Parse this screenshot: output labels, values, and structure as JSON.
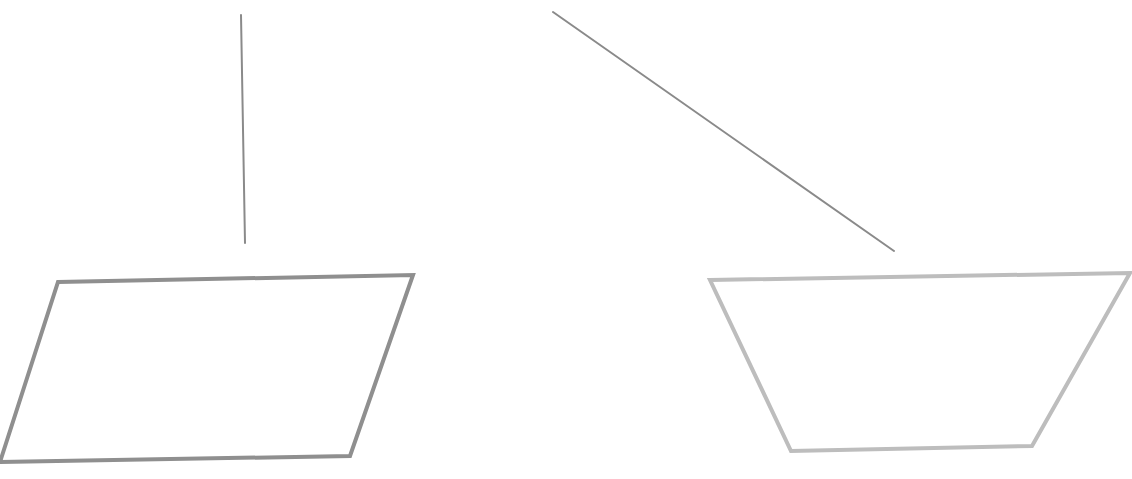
{
  "diagram": {
    "background": "#ffffff",
    "shapes": [
      {
        "id": "vertical-line",
        "type": "line",
        "points": [
          [
            241,
            15
          ],
          [
            245,
            243
          ]
        ],
        "stroke": "#8a8a8a",
        "stroke_width": 2
      },
      {
        "id": "diagonal-line",
        "type": "line",
        "points": [
          [
            553,
            12
          ],
          [
            894,
            251
          ]
        ],
        "stroke": "#8a8a8a",
        "stroke_width": 2
      },
      {
        "id": "parallelogram",
        "type": "polygon",
        "points": [
          [
            58,
            282
          ],
          [
            413,
            275
          ],
          [
            350,
            456
          ],
          [
            0,
            462
          ]
        ],
        "stroke": "#8f8f8f",
        "stroke_width": 4,
        "fill": "none"
      },
      {
        "id": "trapezoid",
        "type": "polygon",
        "points": [
          [
            710,
            280
          ],
          [
            1130,
            273
          ],
          [
            1032,
            446
          ],
          [
            791,
            451
          ]
        ],
        "stroke": "#bdbdbd",
        "stroke_width": 4,
        "fill": "none"
      }
    ],
    "footer_text_clipped": {
      "text": "",
      "note_visible": "only tops of ascenders visible at bottom edge"
    }
  }
}
